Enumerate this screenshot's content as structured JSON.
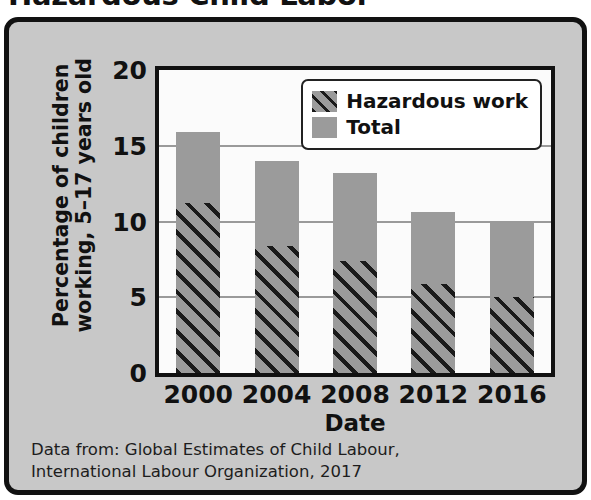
{
  "title": "Hazardous Child Labor",
  "panel": {
    "background_color": "#c8c8c8",
    "border_color": "#111111"
  },
  "axes": {
    "ylabel_line1": "Percentage of children",
    "ylabel_line2": "working, 5–17 years old",
    "xlabel": "Date",
    "yticks": [
      "0",
      "5",
      "10",
      "15",
      "20"
    ],
    "xticks": [
      "2000",
      "2004",
      "2008",
      "2012",
      "2016"
    ]
  },
  "legend": {
    "items": [
      {
        "label": "Hazardous work",
        "swatch": "hatched",
        "color": "#9b9b9b"
      },
      {
        "label": "Total",
        "swatch": "solid",
        "color": "#9b9b9b"
      }
    ]
  },
  "footnote": {
    "line1": "Data from: Global Estimates of Child Labour,",
    "line2": "International Labour Organization, 2017"
  },
  "chart_data": {
    "type": "bar",
    "title": "Hazardous Child Labor",
    "xlabel": "Date",
    "ylabel": "Percentage of children working, 5–17 years old",
    "categories": [
      "2000",
      "2004",
      "2008",
      "2012",
      "2016"
    ],
    "series": [
      {
        "name": "Total",
        "color": "#9b9b9b",
        "fill": "solid",
        "values": [
          15.9,
          14.0,
          13.2,
          10.6,
          9.9
        ]
      },
      {
        "name": "Hazardous work",
        "color": "#9b9b9b",
        "fill": "hatched",
        "values": [
          11.2,
          8.4,
          7.4,
          5.9,
          5.0
        ]
      }
    ],
    "ylim": [
      0,
      20
    ],
    "ytick_step": 5,
    "grid": true,
    "grid_axis": "y",
    "legend_position": "top-right",
    "overlay": true,
    "note": "Hazardous-work bars are drawn from the baseline overlapping the Total bars of the same width."
  }
}
